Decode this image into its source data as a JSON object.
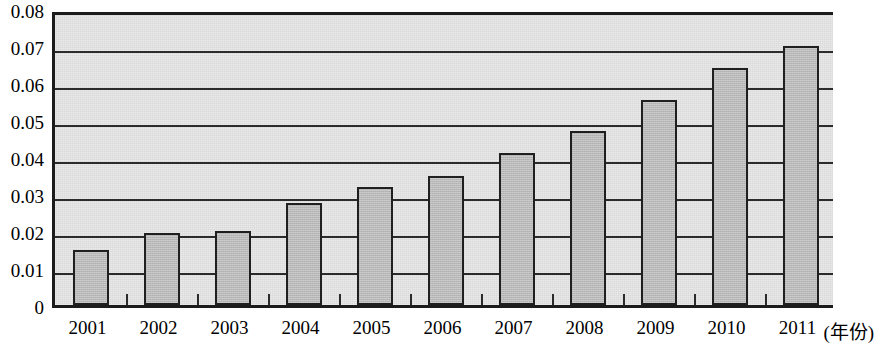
{
  "chart_data": {
    "type": "bar",
    "title": "",
    "subtitle": "",
    "xlabel": "(年份)",
    "ylabel": "",
    "categories": [
      "2001",
      "2002",
      "2003",
      "2004",
      "2005",
      "2006",
      "2007",
      "2008",
      "2009",
      "2010",
      "2011"
    ],
    "values": [
      0.015,
      0.0195,
      0.02,
      0.0275,
      0.032,
      0.035,
      0.041,
      0.047,
      0.0555,
      0.064,
      0.07
    ],
    "series": [
      {
        "name": "",
        "values": [
          0.015,
          0.0195,
          0.02,
          0.0275,
          0.032,
          0.035,
          0.041,
          0.047,
          0.0555,
          0.064,
          0.07
        ]
      }
    ],
    "ylim": [
      0,
      0.08
    ],
    "ytick_labels": [
      "0.08",
      "0.07",
      "0.06",
      "0.05",
      "0.04",
      "0.03",
      "0.02",
      "0.01",
      "0"
    ],
    "ytick_values": [
      0.08,
      0.07,
      0.06,
      0.05,
      0.04,
      0.03,
      0.02,
      0.01,
      0
    ],
    "grid": true,
    "grid_axis": "y",
    "legend": false,
    "legend_position": "none",
    "annotations": [],
    "colors": {
      "bar_fill": "#b9b9b9",
      "bar_border": "#1f1f1f",
      "plot_background": "#d9d9d9",
      "gridline": "#2b2b2b",
      "axis": "#1c1c1c",
      "text": "#000000",
      "page_background": "#ffffff"
    }
  }
}
